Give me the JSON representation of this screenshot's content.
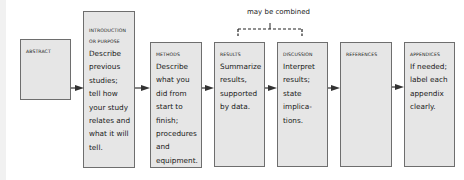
{
  "diagram": {
    "type": "flow",
    "annotation": "may be combined",
    "annotation_spans": [
      "RESULTS",
      "DISCUSSION"
    ],
    "colors": {
      "box_fill": "#e6e6e6",
      "box_border": "#6e6e6e",
      "arrow": "#333333"
    },
    "boxes": [
      {
        "id": "abstract",
        "heading": "ABSTRACT",
        "body": ""
      },
      {
        "id": "introduction",
        "heading": "INTRODUCTION",
        "heading2": "or PURPOSE",
        "body": "Describe previous studies; tell how your study relates and what it will tell."
      },
      {
        "id": "methods",
        "heading": "METHODS",
        "body": "Describe what you did from start to finish; procedures and equipment."
      },
      {
        "id": "results",
        "heading": "RESULTS",
        "body": "Summarize results, supported by data."
      },
      {
        "id": "discussion",
        "heading": "DISCUSSION",
        "body": "Interpret results; state implica-tions."
      },
      {
        "id": "references",
        "heading": "REFERENCES",
        "body": ""
      },
      {
        "id": "appendices",
        "heading": "APPENDICES",
        "body": "If needed; label each appendix clearly."
      }
    ]
  }
}
